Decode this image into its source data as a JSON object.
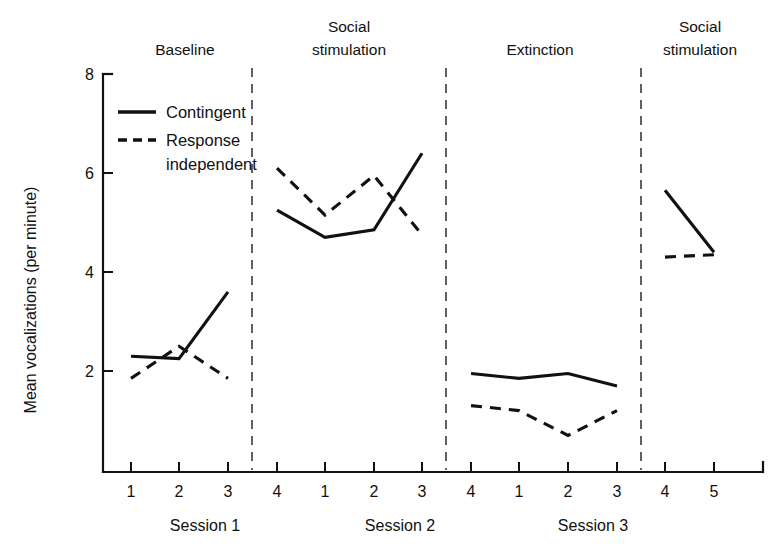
{
  "figure": {
    "background": "#ffffff",
    "ink_color": "#111111"
  },
  "chart_data": {
    "type": "line",
    "title": "",
    "xlabel": "",
    "ylabel": "Mean vocalizations (per minute)",
    "ylim": [
      0,
      8
    ],
    "y_ticks": [
      2,
      4,
      6,
      8
    ],
    "y_tick_labels": [
      "2",
      "4",
      "6",
      "8"
    ],
    "grid": false,
    "legend_position": "upper-left-inside",
    "x_tick_labels": [
      "1",
      "2",
      "3",
      "4",
      "1",
      "2",
      "3",
      "4",
      "1",
      "2",
      "3",
      "4",
      "5"
    ],
    "x_index": [
      1,
      2,
      3,
      4,
      5,
      6,
      7,
      8,
      9,
      10,
      11,
      12,
      13
    ],
    "group_labels": [
      "Session 1",
      "Session 2",
      "Session 3"
    ],
    "phases": [
      {
        "label": "Baseline",
        "x_from": 1,
        "x_to": 3
      },
      {
        "label": "Social\nstimulation",
        "label_line1": "Social",
        "label_line2": "stimulation",
        "x_from": 4,
        "x_to": 7
      },
      {
        "label": "Extinction",
        "x_from": 8,
        "x_to": 11
      },
      {
        "label": "Social\nstimulation",
        "label_line1": "Social",
        "label_line2": "stimulation",
        "x_from": 12,
        "x_to": 13
      }
    ],
    "phase_separators_at_x": [
      3.5,
      7.5,
      11.5
    ],
    "series": [
      {
        "name": "Contingent",
        "style": "solid",
        "segments": [
          {
            "x": [
              1,
              2,
              3
            ],
            "values": [
              2.3,
              2.25,
              3.6
            ]
          },
          {
            "x": [
              4,
              5,
              6,
              7
            ],
            "values": [
              5.25,
              4.7,
              4.85,
              6.4
            ]
          },
          {
            "x": [
              8,
              9,
              10,
              11
            ],
            "values": [
              1.95,
              1.85,
              1.95,
              1.7
            ]
          },
          {
            "x": [
              12,
              13
            ],
            "values": [
              5.65,
              4.4
            ]
          }
        ]
      },
      {
        "name": "Response independent",
        "style": "dashed",
        "segments": [
          {
            "x": [
              1,
              2,
              3
            ],
            "values": [
              1.85,
              2.5,
              1.85
            ]
          },
          {
            "x": [
              4,
              5,
              6,
              7
            ],
            "values": [
              6.1,
              5.15,
              5.95,
              4.75
            ]
          },
          {
            "x": [
              8,
              9,
              10,
              11
            ],
            "values": [
              1.3,
              1.2,
              0.7,
              1.2
            ]
          },
          {
            "x": [
              12,
              13
            ],
            "values": [
              4.3,
              4.35
            ]
          }
        ]
      }
    ],
    "legend": [
      {
        "label": "Contingent",
        "style": "solid"
      },
      {
        "label": "Response",
        "label2": "independent",
        "style": "dashed"
      }
    ]
  },
  "legend": {
    "contingent": "Contingent",
    "response_line1": "Response",
    "response_line2": "independent"
  },
  "axis": {
    "y_title": "Mean vocalizations (per minute)",
    "y_ticks": [
      "8",
      "6",
      "4",
      "2"
    ],
    "x_ticks": [
      "1",
      "2",
      "3",
      "4",
      "1",
      "2",
      "3",
      "4",
      "1",
      "2",
      "3",
      "4",
      "5"
    ],
    "sessions": [
      "Session 1",
      "Session 2",
      "Session 3"
    ]
  },
  "phases": {
    "baseline": "Baseline",
    "social_1_line1": "Social",
    "social_1_line2": "stimulation",
    "extinction": "Extinction",
    "social_2_line1": "Social",
    "social_2_line2": "stimulation"
  }
}
